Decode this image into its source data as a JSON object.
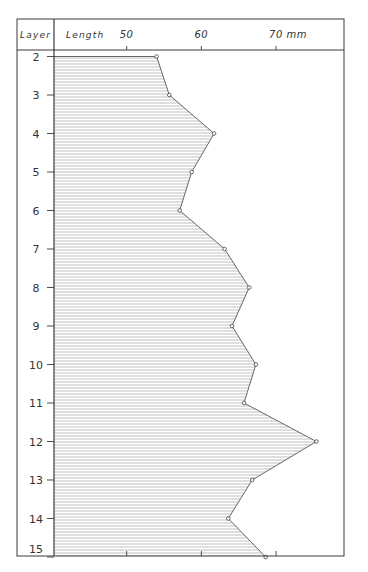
{
  "chart_data": {
    "type": "area",
    "orientation": "vertical-profile",
    "title": "",
    "header": {
      "left": "Layer",
      "right": "Length"
    },
    "xlabel": "Length",
    "x_unit": "mm",
    "ylabel": "Layer",
    "xlim": [
      39.8,
      85.8
    ],
    "x_ticks": [
      50,
      60,
      70
    ],
    "x_tick_labels": [
      "50",
      "60",
      "70 mm"
    ],
    "categories": [
      "2",
      "3",
      "4",
      "5",
      "6",
      "7",
      "8",
      "9",
      "10",
      "11",
      "12",
      "13",
      "14",
      "15"
    ],
    "values": [
      54.0,
      55.7,
      61.7,
      58.7,
      57.1,
      63.1,
      66.4,
      64.1,
      67.3,
      65.7,
      75.4,
      66.8,
      63.6,
      68.6
    ],
    "fill": "horizontal hatching",
    "grid": false,
    "legend": null
  },
  "colors": {
    "frame": "#3a3a3a",
    "line": "#555555",
    "hatch": "#b8b8b8",
    "text": "#333333"
  }
}
